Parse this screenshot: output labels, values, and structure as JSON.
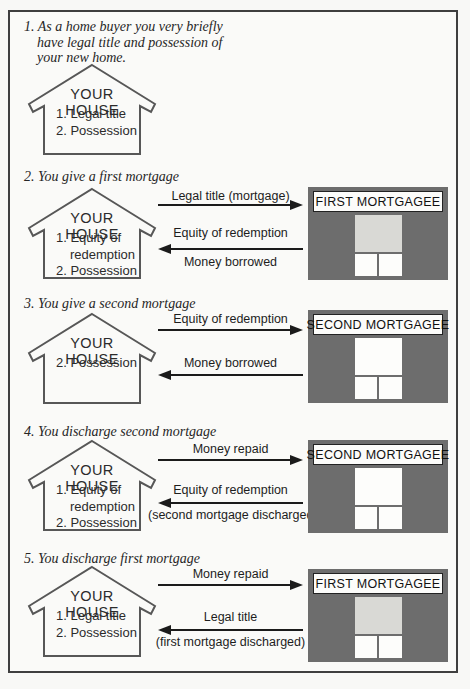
{
  "header": {
    "clipped_title": "FOR A LOAN"
  },
  "colors": {
    "paper": "#f8f8f6",
    "border_ink": "#3f3f3f",
    "arrow_ink": "#1b1b1b",
    "building_gray": "#6d6d6d",
    "center_square_light": "#d9d9d5",
    "center_square_white": "#fdfdfb"
  },
  "icons": {
    "house": "house-outline-icon",
    "arrow_right": "arrow-right-icon",
    "arrow_left": "arrow-left-icon"
  },
  "sections": [
    {
      "heading_lines": [
        "1. As a home buyer you very briefly",
        "have legal title and possession of",
        "your new home."
      ],
      "house": {
        "title": "YOUR HOUSE",
        "items": [
          "1. Legal title",
          "2. Possession"
        ]
      }
    },
    {
      "heading_lines": [
        "2. You give a first mortgage"
      ],
      "house": {
        "title": "YOUR HOUSE",
        "items": [
          "1. Equity of redemption",
          "2. Possession"
        ]
      },
      "building": {
        "name": "FIRST MORTGAGEE",
        "center_square": "light"
      },
      "arrow_right": {
        "label": "Legal title (mortgage)"
      },
      "arrow_left": {
        "label": "Equity of redemption",
        "sublabel": "Money borrowed"
      }
    },
    {
      "heading_lines": [
        "3. You give a second mortgage"
      ],
      "house": {
        "title": "YOUR HOUSE",
        "items": [
          "2. Possession"
        ]
      },
      "building": {
        "name": "SECOND MORTGAGEE",
        "center_square": "white"
      },
      "arrow_right": {
        "label": "Equity of redemption"
      },
      "arrow_left": {
        "label": "Money borrowed"
      }
    },
    {
      "heading_lines": [
        "4. You discharge second mortgage"
      ],
      "house": {
        "title": "YOUR HOUSE",
        "items": [
          "1. Equity of redemption",
          "2. Possession"
        ]
      },
      "building": {
        "name": "SECOND MORTGAGEE",
        "center_square": "white"
      },
      "arrow_right": {
        "label": "Money repaid"
      },
      "arrow_left": {
        "label": "Equity of redemption",
        "sublabel": "(second mortgage discharged)"
      }
    },
    {
      "heading_lines": [
        "5. You discharge first mortgage"
      ],
      "house": {
        "title": "YOUR HOUSE",
        "items": [
          "1. Legal title",
          "2. Possession"
        ]
      },
      "building": {
        "name": "FIRST MORTGAGEE",
        "center_square": "light"
      },
      "arrow_right": {
        "label": "Money repaid"
      },
      "arrow_left": {
        "label": "Legal title",
        "sublabel": "(first mortgage discharged)"
      }
    }
  ]
}
